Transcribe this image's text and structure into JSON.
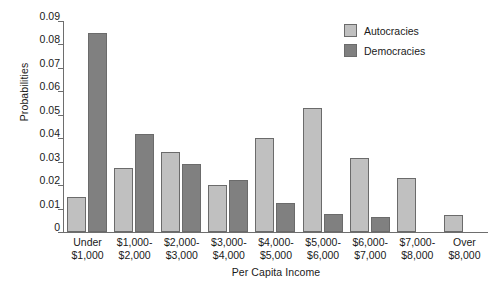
{
  "chart_data": {
    "type": "bar",
    "title": "",
    "subtitle": "",
    "xlabel": "Per Capita Income",
    "ylabel": "Probabilities",
    "ylim": [
      0,
      0.09
    ],
    "yticks": [
      "0",
      "0.01",
      "0.02",
      "0.03",
      "0.04",
      "0.05",
      "0.06",
      "0.07",
      "0.08",
      "0.09"
    ],
    "ytick_values": [
      0,
      0.01,
      0.02,
      0.03,
      0.04,
      0.05,
      0.06,
      0.07,
      0.08,
      0.09
    ],
    "grid": false,
    "legend_position": "top-right",
    "categories": [
      "Under $1,000",
      "$1,000-$2,000",
      "$2,000-$3,000",
      "$3,000-$4,000",
      "$4,000-$5,000",
      "$5,000-$6,000",
      "$6,000-$7,000",
      "$7,000-$8,000",
      "Over $8,000"
    ],
    "category_lines": [
      [
        "Under",
        "$1,000"
      ],
      [
        "$1,000-",
        "$2,000"
      ],
      [
        "$2,000-",
        "$3,000"
      ],
      [
        "$3,000-",
        "$4,000"
      ],
      [
        "$4,000-",
        "$5,000"
      ],
      [
        "$5,000-",
        "$6,000"
      ],
      [
        "$6,000-",
        "$7,000"
      ],
      [
        "$7,000-",
        "$8,000"
      ],
      [
        "Over",
        "$8,000"
      ]
    ],
    "series": [
      {
        "name": "Autocracies",
        "color": "#c0c0c0",
        "values": [
          0.015,
          0.0275,
          0.034,
          0.02,
          0.04,
          0.053,
          0.0315,
          0.023,
          0.0072
        ]
      },
      {
        "name": "Democracies",
        "color": "#808080",
        "values": [
          0.085,
          0.042,
          0.029,
          0.022,
          0.0122,
          0.0078,
          0.0065,
          0,
          0
        ]
      }
    ]
  },
  "legend": {
    "items": [
      {
        "label": "Autocracies",
        "color": "#c0c0c0"
      },
      {
        "label": "Democracies",
        "color": "#808080"
      }
    ]
  },
  "axes": {
    "y_title": "Probabilities",
    "x_title": "Per Capita Income"
  }
}
